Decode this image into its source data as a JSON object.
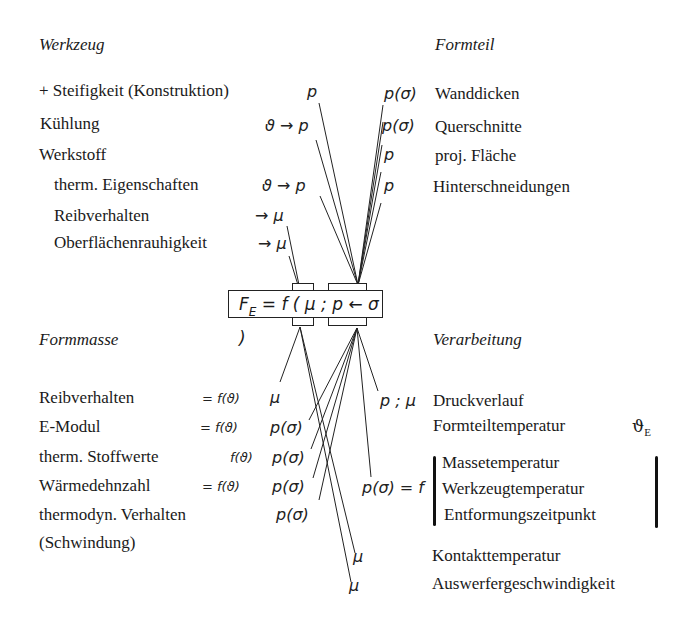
{
  "formula": {
    "F": "F",
    "sub": "E",
    "rest": " = f ( μ ; p ← σ )"
  },
  "werkzeug": {
    "title": "Werkzeug",
    "items": [
      {
        "label": "+ Steifigkeit (Konstruktion)",
        "symbol": "p"
      },
      {
        "label": "Kühlung",
        "symbol": "ϑ → p"
      },
      {
        "label": "Werkstoff",
        "symbol": ""
      },
      {
        "label": "therm. Eigenschaften",
        "symbol": "ϑ → p"
      },
      {
        "label": "Reibverhalten",
        "symbol": "→ μ"
      },
      {
        "label": "Oberflächenrauhigkeit",
        "symbol": "→ μ"
      }
    ]
  },
  "formteil": {
    "title": "Formteil",
    "items": [
      {
        "label": "Wanddicken",
        "symbol": "p(σ)"
      },
      {
        "label": "Querschnitte",
        "symbol": "p(σ)"
      },
      {
        "label": "proj. Fläche",
        "symbol": "p"
      },
      {
        "label": "Hinterschneidungen",
        "symbol": "p"
      }
    ]
  },
  "formmasse": {
    "title": "Formmasse",
    "items": [
      {
        "label": "Reibverhalten",
        "fn": "= f(ϑ)",
        "symbol": "μ"
      },
      {
        "label": "E-Modul",
        "fn": "= f(ϑ)",
        "symbol": "p(σ)"
      },
      {
        "label": "therm. Stoffwerte",
        "fn": "f(ϑ)",
        "symbol": "p(σ)"
      },
      {
        "label": "Wärmedehnzahl",
        "fn": "= f(ϑ)",
        "symbol": "p(σ)"
      },
      {
        "label": "thermodyn. Verhalten",
        "fn": "",
        "symbol": "p(σ)"
      },
      {
        "label": "(Schwindung)",
        "fn": "",
        "symbol": ""
      }
    ]
  },
  "verarbeitung": {
    "title": "Verarbeitung",
    "items": [
      {
        "label": "Druckverlauf",
        "symbol": "p ; μ"
      },
      {
        "label": "Formteiltemperatur",
        "suffix": "ϑ",
        "suffix_sub": "E"
      },
      {
        "label": "Massetemperatur",
        "symbol": "p(σ) = f"
      },
      {
        "label": "Werkzeugtemperatur"
      },
      {
        "label": "Entformungszeitpunkt"
      },
      {
        "label": "Kontakttemperatur",
        "symbol": "μ"
      },
      {
        "label": "Auswerfergeschwindigkeit",
        "symbol": "μ"
      }
    ]
  }
}
